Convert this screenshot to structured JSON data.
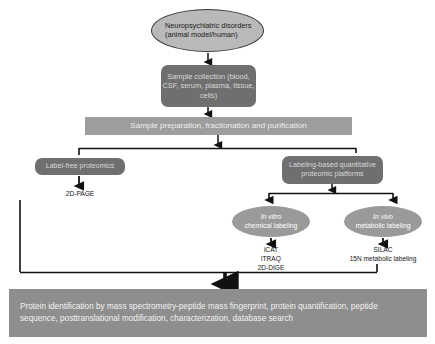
{
  "diagram": {
    "colors": {
      "ellipse_top_fill": "#b9b9b9",
      "box_dark_fill": "#6f6f6f",
      "bar_fill": "#9d9d9d",
      "bar_bottom_fill": "#8e8e8e",
      "ellipse_gray_fill": "#9a9a9a",
      "connector": "#111111",
      "background": "#ffffff"
    },
    "nodes": {
      "neuropsychiatric": "Neuropsychiatric disorders (animal model/human)",
      "sample_collection": "Sample collection (blood, CSF, serum, plasma, tissue, cells)",
      "sample_preparation": "Sample preparation, fractionation and purification",
      "label_free": "Label-free proteomics",
      "labeling_based": "Labeling-based quantitative proteomic platforms",
      "in_vitro_italic": "In vitro",
      "in_vitro_rest": "chemical labeling",
      "in_vivo_italic": "In vivo",
      "in_vivo_rest": "metabolic labeling",
      "two_d_page": "2D-PAGE",
      "in_vitro_methods": "iCAT\niTRAQ\n2D-DIGE",
      "in_vivo_methods": "SILAC\n15N metabolic labeling",
      "protein_identification": "Protein identification by mass spectrometry-peptide mass fingerprint, protein quantification, peptide sequence, posttranslational  modification, characterization, database search"
    }
  }
}
